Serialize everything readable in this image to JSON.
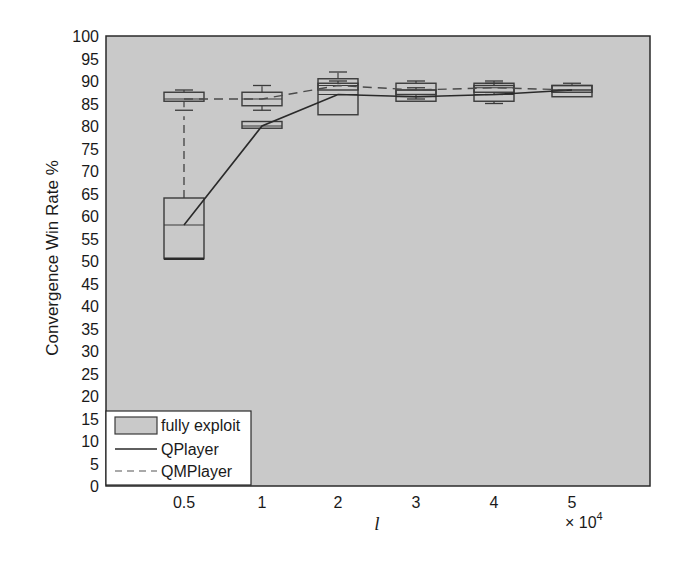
{
  "chart_data": {
    "type": "box",
    "title": "",
    "xlabel": "l",
    "ylabel": "Convergence Win Rate %",
    "x_multiplier": "× 10^4",
    "categories": [
      "0.5",
      "1",
      "2",
      "3",
      "4",
      "5"
    ],
    "ylim": [
      0,
      100
    ],
    "yticks": [
      0,
      5,
      10,
      15,
      20,
      25,
      30,
      35,
      40,
      45,
      50,
      55,
      60,
      65,
      70,
      75,
      80,
      85,
      90,
      95,
      100
    ],
    "grid": false,
    "legend_position": "lower left",
    "legend": [
      "fully exploit",
      "QPlayer",
      "QMPlayer"
    ],
    "series": [
      {
        "name": "QPlayer",
        "line_style": "solid",
        "medians": [
          58,
          80,
          87,
          86.5,
          87,
          88
        ],
        "q1": [
          50.5,
          79.5,
          82.5,
          85.5,
          85.5,
          86.5
        ],
        "q3": [
          64,
          81,
          89.5,
          88,
          89,
          89
        ],
        "whisker_low": [
          50.5,
          79.5,
          82.5,
          85.5,
          85,
          86.5
        ],
        "whisker_high": [
          64,
          81,
          90,
          88.5,
          89.5,
          89
        ]
      },
      {
        "name": "QMPlayer",
        "line_style": "dashed",
        "medians": [
          86,
          86,
          89,
          88,
          88.5,
          88
        ],
        "q1": [
          85.5,
          84.5,
          88,
          87,
          87.5,
          87.5
        ],
        "q3": [
          87.5,
          87.5,
          90.5,
          89.5,
          89.5,
          89
        ],
        "whisker_low": [
          83.5,
          83.5,
          88,
          86,
          87,
          87.5
        ],
        "whisker_high": [
          88,
          89,
          92,
          90,
          90,
          89.5
        ]
      }
    ]
  },
  "labels": {
    "ylabel": "Convergence Win Rate %",
    "xlabel": "l",
    "x_multiplier_base": "× 10",
    "x_multiplier_exp": "4",
    "legend_fully_exploit": "fully exploit",
    "legend_qplayer": "QPlayer",
    "legend_qmplayer": "QMPlayer"
  },
  "colors": {
    "plot_background": "#c9c9c9",
    "axis": "#2a2a2a",
    "box_edge": "#3a3a3a",
    "qplayer_line": "#2a2a2a",
    "qmplayer_line": "#4a4a4a"
  }
}
